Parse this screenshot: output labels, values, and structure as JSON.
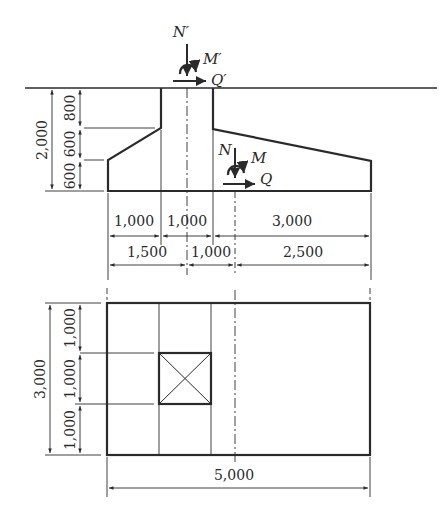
{
  "elevation": {
    "loads_top": {
      "axial": "N′",
      "moment": "M′",
      "shear": "Q′"
    },
    "loads_base": {
      "axial": "N",
      "moment": "M",
      "shear": "Q"
    },
    "vertical_dims": {
      "total": "2,000",
      "top": "800",
      "middle": "600",
      "bottom": "600"
    },
    "horizontal_dims_row1": [
      "1,000",
      "1,000",
      "3,000"
    ],
    "horizontal_dims_row2": [
      "1,500",
      "1,000",
      "2,500"
    ]
  },
  "plan": {
    "vertical_dims": {
      "total": "3,000",
      "top": "1,000",
      "middle": "1,000",
      "bottom": "1,000"
    },
    "width_dim": "5,000"
  },
  "colors": {
    "line": "#2a2a2a",
    "background": "#ffffff"
  }
}
